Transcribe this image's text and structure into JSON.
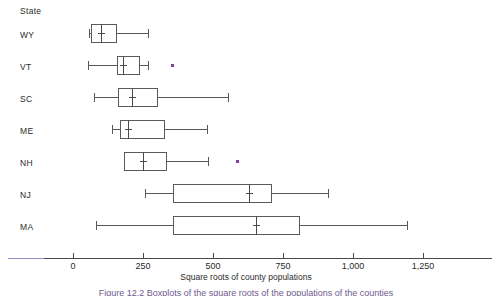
{
  "figure": {
    "category_axis_title": "State",
    "value_axis_title": "Square roots of county populations",
    "caption": "Figure 12.2  Boxplots of the square roots of the populations of the counties",
    "marker_color": "#8a3f9e",
    "line_color": "#595959"
  },
  "axis": {
    "ticks": [
      {
        "label": "0",
        "value": 0
      },
      {
        "label": "250",
        "value": 250
      },
      {
        "label": "500",
        "value": 500
      },
      {
        "label": "750",
        "value": 750
      },
      {
        "label": "1,000",
        "value": 1000
      },
      {
        "label": "1,250",
        "value": 1250
      }
    ],
    "min": 0,
    "max": 1250
  },
  "chart_data": {
    "type": "box",
    "title": "",
    "xlabel": "Square roots of county populations",
    "ylabel": "State",
    "xlim": [
      0,
      1250
    ],
    "grid": false,
    "legend": "none",
    "orientation": "horizontal",
    "categories": [
      "WY",
      "VT",
      "SC",
      "ME",
      "NH",
      "NJ",
      "MA"
    ],
    "boxes": [
      {
        "category": "WY",
        "min": 57,
        "q1": 64,
        "median": 100,
        "q3": 157,
        "max": 268,
        "outliers": []
      },
      {
        "category": "VT",
        "min": 54,
        "q1": 157,
        "median": 179,
        "q3": 239,
        "max": 268,
        "outliers": [
          354
        ]
      },
      {
        "category": "SC",
        "min": 75,
        "q1": 161,
        "median": 211,
        "q3": 304,
        "max": 554,
        "outliers": []
      },
      {
        "category": "ME",
        "min": 139,
        "q1": 168,
        "median": 196,
        "q3": 329,
        "max": 479,
        "outliers": []
      },
      {
        "category": "NH",
        "min": 182,
        "q1": 182,
        "median": 250,
        "q3": 336,
        "max": 482,
        "outliers": [
          586
        ]
      },
      {
        "category": "NJ",
        "min": 257,
        "q1": 357,
        "median": 629,
        "q3": 711,
        "max": 911,
        "outliers": []
      },
      {
        "category": "MA",
        "min": 82,
        "q1": 357,
        "median": 654,
        "q3": 811,
        "max": 1193,
        "outliers": []
      }
    ]
  },
  "labels": {
    "state_header": "State",
    "wy": "WY",
    "vt": "VT",
    "sc": "SC",
    "me": "ME",
    "nh": "NH",
    "nj": "NJ",
    "ma": "MA"
  }
}
